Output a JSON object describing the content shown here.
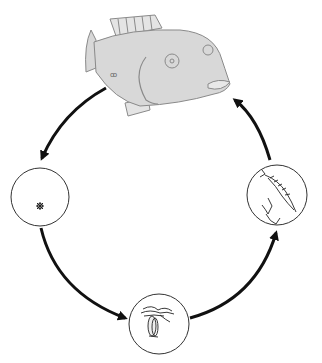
{
  "diagram": {
    "type": "life-cycle",
    "title": "",
    "stages": [
      {
        "id": "adult",
        "name": "adult fish",
        "label": ""
      },
      {
        "id": "egg",
        "name": "egg",
        "label": ""
      },
      {
        "id": "larva",
        "name": "larva",
        "label": ""
      },
      {
        "id": "juvenile",
        "name": "juvenile / post-larva",
        "label": ""
      }
    ],
    "edges": [
      {
        "from": "adult",
        "to": "egg"
      },
      {
        "from": "egg",
        "to": "larva"
      },
      {
        "from": "larva",
        "to": "juvenile"
      },
      {
        "from": "juvenile",
        "to": "adult"
      }
    ],
    "colors": {
      "fish_fill": "#d8d8d8",
      "fish_outline": "#8a8a8a",
      "arrow": "#111111",
      "circle_stroke": "#333333"
    }
  }
}
